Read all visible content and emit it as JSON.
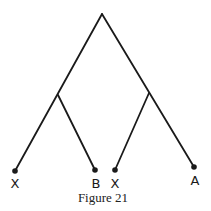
{
  "figure": {
    "caption": "Figure 21",
    "line_color": "#1a1a1a",
    "tree": {
      "root": {
        "x": 102,
        "y": 14
      },
      "internal_nodes": [
        {
          "name": "left-internal",
          "x": 58,
          "y": 95
        },
        {
          "name": "right-internal",
          "x": 149,
          "y": 93
        }
      ],
      "leaves": [
        {
          "label": "X",
          "x": 15,
          "y": 171,
          "parent": "left-internal"
        },
        {
          "label": "B",
          "x": 95,
          "y": 170,
          "parent": "left-internal"
        },
        {
          "label": "X",
          "x": 115,
          "y": 170,
          "parent": "right-internal"
        },
        {
          "label": "A",
          "x": 194,
          "y": 167,
          "parent": "right-internal"
        }
      ]
    }
  }
}
